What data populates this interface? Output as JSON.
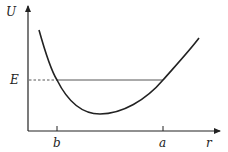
{
  "diagram": {
    "type": "potential-energy-curve",
    "axes": {
      "y_label": "U",
      "x_label": "r"
    },
    "energy_level": {
      "label": "E",
      "style_left": "dashed",
      "style_right": "solid"
    },
    "ticks": [
      {
        "label": "b",
        "position": "left turning point"
      },
      {
        "label": "a",
        "position": "right turning point"
      }
    ],
    "colors": {
      "stroke": "#222222",
      "background": "#ffffff"
    }
  }
}
